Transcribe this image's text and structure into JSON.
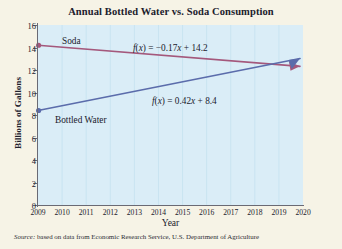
{
  "chart_data": {
    "type": "line",
    "title": "Annual Bottled Water vs. Soda Consumption",
    "xlabel": "Year",
    "ylabel": "Billions of Gallons",
    "xlim": [
      2009,
      2020
    ],
    "ylim": [
      0,
      16
    ],
    "x_ticks": [
      "2009",
      "2010",
      "2011",
      "2012",
      "2013",
      "2014",
      "2015",
      "2016",
      "2017",
      "2018",
      "2019",
      "2020"
    ],
    "y_ticks": [
      "0",
      "2",
      "4",
      "6",
      "8",
      "10",
      "12",
      "14",
      "16"
    ],
    "grid": "vertical-only",
    "legend": "inline-labels",
    "x": [
      2009,
      2020
    ],
    "series": [
      {
        "name": "Soda",
        "label": "Soda",
        "equation": "f(x) = −0.17x + 14.2",
        "slope": -0.17,
        "intercept": 14.2,
        "color": "#a4587c",
        "values": [
          14.2,
          12.33
        ],
        "start_point": {
          "x": 2009,
          "y": 14.2
        },
        "end_point": {
          "x": 2020,
          "y": 12.33
        },
        "marker": "dot-at-start",
        "arrow": "at-end"
      },
      {
        "name": "Bottled Water",
        "label": "Bottled Water",
        "equation": "f(x) = 0.42x + 8.4",
        "slope": 0.42,
        "intercept": 8.4,
        "color": "#5b6cab",
        "values": [
          8.4,
          13.02
        ],
        "start_point": {
          "x": 2009,
          "y": 8.4
        },
        "end_point": {
          "x": 2020,
          "y": 13.02
        },
        "marker": "dot-at-start",
        "arrow": "at-end"
      }
    ],
    "annotations": [
      {
        "name": "soda-equation",
        "text": "f(x) = −0.17x + 14.2"
      },
      {
        "name": "bottled-water-equation",
        "text": "f(x) = 0.42x + 8.4"
      }
    ]
  },
  "source": {
    "prefix": "Source:",
    "text": " based on data from Economic Research Service, U.S. Department of Agriculture"
  },
  "colors": {
    "page_background": "#f6f3e6",
    "plot_background": "#daedf7",
    "gridline": "#c7e2f0",
    "axis": "#6a6a74",
    "soda": "#a4587c",
    "bottled_water": "#5b6cab",
    "text": "#20202c"
  }
}
